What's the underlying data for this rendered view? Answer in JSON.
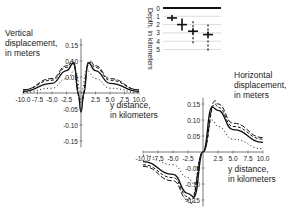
{
  "chart_data": [
    {
      "type": "line",
      "title": "Vertical displacement, in meters",
      "ylabel": "Vertical displacement, in meters",
      "xlabel": "y distance, in kilometers",
      "x_ticks": [
        "-10.0",
        "-7.5",
        "-5.0",
        "-2.5",
        "2.5",
        "5.0",
        "7.5",
        "10.0"
      ],
      "y_ticks": [
        "0.15",
        "0.10",
        "0.05",
        "-0.05",
        "-0.10",
        "-0.15"
      ],
      "xlim": [
        -10,
        10
      ],
      "ylim": [
        -0.17,
        0.17
      ],
      "series": [
        {
          "name": "depth 1 km (solid)",
          "style": "solid",
          "x": [
            -10,
            -5,
            -2.5,
            -1.2,
            -0.5,
            0,
            0.5,
            1.2,
            2.5,
            5,
            10
          ],
          "values": [
            0.005,
            0.03,
            0.07,
            0.095,
            0.0,
            -0.06,
            0.0,
            0.095,
            0.07,
            0.03,
            0.005
          ]
        },
        {
          "name": "depth 2 km (long dash)",
          "style": "dash",
          "x": [
            -10,
            -5,
            -2.5,
            -1.5,
            0,
            1.5,
            2.5,
            5,
            10
          ],
          "values": [
            0.01,
            0.045,
            0.085,
            0.1,
            -0.03,
            0.1,
            0.085,
            0.045,
            0.01
          ]
        },
        {
          "name": "depth 3 km (short dash)",
          "style": "dash-short",
          "x": [
            -10,
            -5,
            -2.5,
            -1.5,
            0,
            1.5,
            2.5,
            5,
            10
          ],
          "values": [
            0.01,
            0.04,
            0.08,
            0.095,
            -0.02,
            0.095,
            0.08,
            0.04,
            0.01
          ]
        },
        {
          "name": "depth 4 km (dotted)",
          "style": "dotted",
          "x": [
            -10,
            -5,
            -2.5,
            -1,
            0,
            1,
            2.5,
            5,
            10
          ],
          "values": [
            0.002,
            0.015,
            0.045,
            0.07,
            0.0,
            0.07,
            0.045,
            0.015,
            0.002
          ]
        }
      ]
    },
    {
      "type": "line",
      "title": "Horizontal displacement, in meters",
      "ylabel": "Horizontal displacement, in meters",
      "xlabel": "y distance, in kilometers",
      "x_ticks": [
        "-10.0",
        "-7.5",
        "-5.0",
        "-2.5",
        "2.5",
        "5.0",
        "7.5",
        "10.0"
      ],
      "y_ticks": [
        "0.15",
        "0.10",
        "0.05",
        "-0.05",
        "-0.10",
        "-0.15"
      ],
      "xlim": [
        -10,
        10
      ],
      "ylim": [
        -0.17,
        0.17
      ],
      "series": [
        {
          "name": "depth 1 km (solid)",
          "style": "solid",
          "x": [
            -10,
            -5,
            -2.5,
            -1.5,
            0,
            1.5,
            2.5,
            5,
            10
          ],
          "values": [
            -0.03,
            -0.07,
            -0.13,
            -0.14,
            0,
            0.14,
            0.13,
            0.07,
            0.03
          ]
        },
        {
          "name": "depth 2 km (long dash)",
          "style": "dash",
          "x": [
            -10,
            -5,
            -2.5,
            -2,
            0,
            2,
            2.5,
            5,
            10
          ],
          "values": [
            -0.045,
            -0.09,
            -0.15,
            -0.16,
            0,
            0.16,
            0.15,
            0.09,
            0.045
          ]
        },
        {
          "name": "depth 3 km (short dash)",
          "style": "dash-short",
          "x": [
            -10,
            -5,
            -2.5,
            -2,
            0,
            2,
            2.5,
            5,
            10
          ],
          "values": [
            -0.04,
            -0.08,
            -0.14,
            -0.15,
            0,
            0.15,
            0.14,
            0.08,
            0.04
          ]
        },
        {
          "name": "depth 4 km (dotted)",
          "style": "dotted",
          "x": [
            -10,
            -5,
            -2.5,
            -1.5,
            0,
            1.5,
            2.5,
            5,
            10
          ],
          "values": [
            -0.01,
            -0.04,
            -0.08,
            -0.1,
            0,
            0.1,
            0.08,
            0.04,
            0.01
          ]
        }
      ]
    },
    {
      "type": "diagram",
      "title": "Depth, in kilometers",
      "ylabel": "Depth, in kilometers",
      "y_ticks": [
        "0",
        "1",
        "2",
        "3",
        "4",
        "5"
      ],
      "markers": [
        {
          "name": "source 1",
          "depth": 1.2
        },
        {
          "name": "source 2",
          "depth": 2.0
        },
        {
          "name": "source 3",
          "depth": 2.8
        },
        {
          "name": "source 4",
          "depth": 3.2
        }
      ]
    }
  ],
  "labels": {
    "vertical_ylabel_line1": "Vertical",
    "vertical_ylabel_line2": "displacement,",
    "vertical_ylabel_line3": "in meters",
    "horizontal_ylabel_line1": "Horizontal",
    "horizontal_ylabel_line2": "displacement,",
    "horizontal_ylabel_line3": "in meters",
    "xlabel_line1": "y distance,",
    "xlabel_line2": "in kilometers",
    "depth_label": "Depth, in kilometers"
  }
}
